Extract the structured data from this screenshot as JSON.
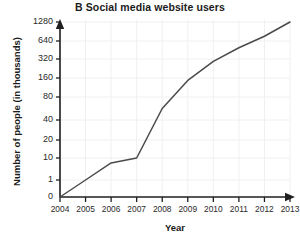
{
  "chart_data": {
    "type": "line",
    "title": "B  Social media website users",
    "xlabel": "Year",
    "ylabel": "Number of people (in thousands)",
    "categories": [
      "2004",
      "2005",
      "2006",
      "2007",
      "2008",
      "2009",
      "2010",
      "2011",
      "2012",
      "2013"
    ],
    "x": [
      2004,
      2005,
      2006,
      2007,
      2008,
      2009,
      2010,
      2011,
      2012,
      2013
    ],
    "values": [
      0,
      1,
      8,
      10,
      60,
      150,
      300,
      520,
      800,
      1280
    ],
    "yticks": [
      0,
      1,
      10,
      20,
      40,
      80,
      160,
      320,
      640,
      1280
    ],
    "ytick_labels": [
      "0",
      "1",
      "10",
      "20",
      "40",
      "80",
      "160",
      "320",
      "640",
      "1280"
    ],
    "yscale": "log-like (doubling steps)",
    "ylim": [
      0,
      1280
    ],
    "xlim": [
      2004,
      2013
    ],
    "grid": true,
    "legend": "none",
    "series": [
      {
        "name": "Social media website users",
        "values": [
          0,
          1,
          8,
          10,
          60,
          150,
          300,
          520,
          800,
          1280
        ]
      }
    ],
    "line_color": "#4a4a4a",
    "grid_color": "#f0f0f2",
    "axis_color": "#1f1f1f"
  }
}
